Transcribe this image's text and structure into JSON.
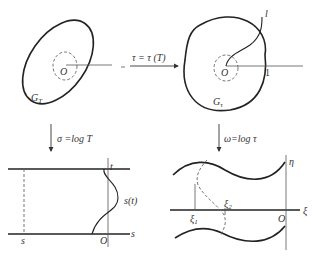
{
  "panels": {
    "top_left": {
      "region_label": "G",
      "region_sub": "T",
      "origin": "O"
    },
    "top_right": {
      "region_label": "G",
      "region_sub": "τ",
      "origin": "O",
      "curve_label": "l",
      "unit_label": "1"
    },
    "bottom_left": {
      "top_label": "t",
      "curve_label": "s(t)",
      "s_label": "s",
      "axis_label": "s",
      "origin": "O"
    },
    "bottom_right": {
      "eta_label": "η",
      "xi_label": "ξ",
      "xi1": "ξ",
      "xi1_sub": "1",
      "xi2": "ξ",
      "xi2_sub": "2",
      "origin": "O"
    }
  },
  "maps": {
    "horizontal": "τ = τ (T)",
    "left_down": "σ =log T",
    "right_down": "ω=log τ"
  }
}
